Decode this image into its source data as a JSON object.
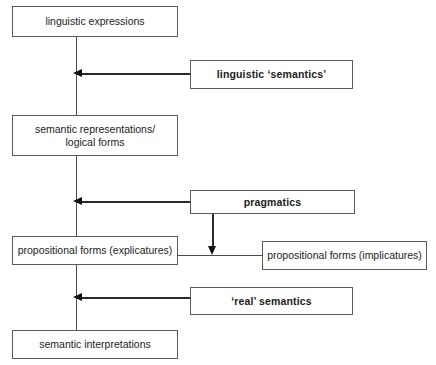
{
  "diagram": {
    "type": "flow-diagram",
    "width": 436,
    "height": 365,
    "colors": {
      "background": "#ffffff",
      "box_border": "#5a5a5a",
      "connector": "#4a4a4a",
      "arrow": "#111111",
      "text": "#1c1c1c"
    }
  },
  "stages": [
    {
      "id": "linguistic-expressions",
      "label": "linguistic expressions"
    },
    {
      "id": "semantic-representations",
      "label": "semantic representations/\nlogical forms"
    },
    {
      "id": "propositional-forms-explicatures",
      "label": "propositional forms (explicatures)"
    },
    {
      "id": "semantic-interpretations",
      "label": "semantic interpretations"
    }
  ],
  "processes": [
    {
      "id": "linguistic-semantics",
      "label": "linguistic ‘semantics’"
    },
    {
      "id": "pragmatics",
      "label": "pragmatics"
    },
    {
      "id": "real-semantics",
      "label": "‘real’ semantics"
    }
  ],
  "branch": {
    "id": "propositional-forms-implicatures",
    "label": "propositional forms (implicatures)"
  }
}
